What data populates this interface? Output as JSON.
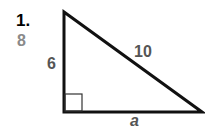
{
  "problem": {
    "number": "1.",
    "answer": "8",
    "colors": {
      "number": "#000000",
      "answer": "#8a8a8a",
      "labels": "#555555",
      "lines": "#111111"
    }
  },
  "triangle": {
    "leg_vertical_label": "6",
    "hypotenuse_label": "10",
    "leg_horizontal_label": "a",
    "right_angle_marker": "right-angle-square"
  }
}
